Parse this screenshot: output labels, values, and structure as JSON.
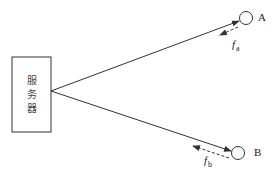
{
  "diagram": {
    "server": {
      "label_chars": [
        "服",
        "务",
        "器"
      ],
      "label": "服务器"
    },
    "nodes": [
      {
        "id": "A",
        "label": "A"
      },
      {
        "id": "B",
        "label": "B"
      }
    ],
    "forces": [
      {
        "id": "fa",
        "symbol": "f",
        "subscript": "a",
        "target": "A"
      },
      {
        "id": "fb",
        "symbol": "f",
        "subscript": "b",
        "target": "B"
      }
    ],
    "colors": {
      "stroke": "#333333",
      "background": "#ffffff"
    }
  }
}
